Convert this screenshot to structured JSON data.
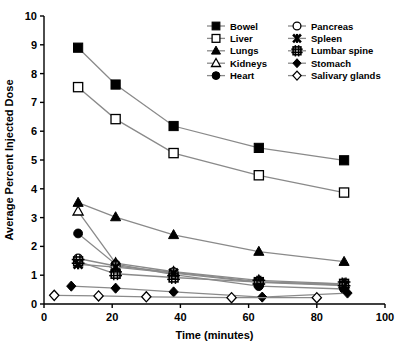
{
  "chart_data": {
    "type": "line",
    "title": "",
    "xlabel": "Time (minutes)",
    "ylabel": "Average Percent Injected Dose",
    "xlim": [
      0,
      100
    ],
    "ylim": [
      0,
      10
    ],
    "xticks": [
      0,
      20,
      40,
      60,
      80,
      100
    ],
    "yticks": [
      0,
      1,
      2,
      3,
      4,
      5,
      6,
      7,
      8,
      9,
      10
    ],
    "grid": false,
    "legend_position": "top-right",
    "legend_columns": 2,
    "series": [
      {
        "name": "Bowel",
        "marker": "filled-square",
        "x": [
          10,
          21,
          38,
          63,
          88
        ],
        "values": [
          8.9,
          7.62,
          6.18,
          5.42,
          4.99
        ]
      },
      {
        "name": "Liver",
        "marker": "open-square",
        "x": [
          10,
          21,
          38,
          63,
          88
        ],
        "values": [
          7.53,
          6.42,
          5.24,
          4.47,
          3.87
        ]
      },
      {
        "name": "Lungs",
        "marker": "filled-triangle",
        "x": [
          10,
          21,
          38,
          63,
          88
        ],
        "values": [
          3.52,
          3.02,
          2.4,
          1.82,
          1.47
        ]
      },
      {
        "name": "Kidneys",
        "marker": "open-triangle",
        "x": [
          10,
          21,
          38,
          63,
          88
        ],
        "values": [
          3.22,
          1.42,
          1.12,
          0.82,
          0.7
        ]
      },
      {
        "name": "Heart",
        "marker": "filled-circle",
        "x": [
          10,
          21,
          38,
          63,
          88
        ],
        "values": [
          2.45,
          1.38,
          1.02,
          0.62,
          0.52
        ]
      },
      {
        "name": "Pancreas",
        "marker": "open-circle",
        "x": [
          10,
          21,
          38,
          63,
          88
        ],
        "values": [
          1.58,
          1.32,
          1.1,
          0.78,
          0.66
        ]
      },
      {
        "name": "Spleen",
        "marker": "star-x",
        "x": [
          10,
          21,
          38,
          63,
          88
        ],
        "values": [
          1.38,
          1.28,
          1.07,
          0.75,
          0.64
        ]
      },
      {
        "name": "Lumbar spine",
        "marker": "hash-square",
        "x": [
          10,
          21,
          38,
          63,
          88
        ],
        "values": [
          1.48,
          1.05,
          0.92,
          0.76,
          0.7
        ]
      },
      {
        "name": "Stomach",
        "marker": "filled-diamond",
        "x": [
          8,
          21,
          38,
          64,
          89
        ],
        "values": [
          0.62,
          0.55,
          0.42,
          0.24,
          0.38
        ]
      },
      {
        "name": "Salivary glands",
        "marker": "open-diamond",
        "x": [
          3,
          16,
          30,
          55,
          80
        ],
        "values": [
          0.3,
          0.28,
          0.25,
          0.22,
          0.22
        ]
      }
    ]
  },
  "legend": {
    "items": [
      {
        "label": "Bowel",
        "marker": "filled-square"
      },
      {
        "label": "Pancreas",
        "marker": "open-circle"
      },
      {
        "label": "Liver",
        "marker": "open-square"
      },
      {
        "label": "Spleen",
        "marker": "star-x"
      },
      {
        "label": "Lungs",
        "marker": "filled-triangle"
      },
      {
        "label": "Lumbar spine",
        "marker": "hash-square"
      },
      {
        "label": "Kidneys",
        "marker": "open-triangle"
      },
      {
        "label": "Stomach",
        "marker": "filled-diamond"
      },
      {
        "label": "Heart",
        "marker": "filled-circle"
      },
      {
        "label": "Salivary glands",
        "marker": "open-diamond"
      }
    ]
  },
  "colors": {
    "ink": "#000000",
    "line": "#8a8a8a",
    "background": "#ffffff"
  }
}
